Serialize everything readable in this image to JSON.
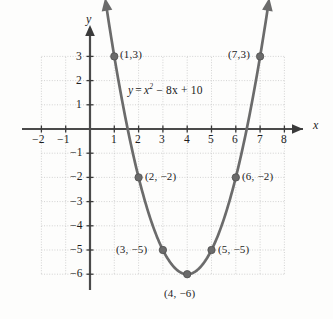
{
  "figure": {
    "type": "coordinate-graph",
    "equation_label": "y = x² − 8x + 10",
    "equation_parts": {
      "lhs": "y",
      "equals": "=",
      "var": "x",
      "exponent": "2",
      "rest": "− 8x + 10"
    },
    "x_axis_name": "x",
    "y_axis_name": "y"
  },
  "chart_data": {
    "type": "line",
    "title": "",
    "subtitle": "",
    "xlabel": "x",
    "ylabel": "y",
    "function": "y = x^2 - 8x + 10",
    "curve_shape": "parabola",
    "vertex": [
      4,
      -6
    ],
    "xlim": [
      -2.6,
      8.6
    ],
    "ylim": [
      -6.8,
      3.8
    ],
    "grid": true,
    "grid_x_range": [
      -2,
      8
    ],
    "grid_y_range": [
      -6,
      3
    ],
    "legend": "none",
    "x_ticks": [
      -2,
      -1,
      1,
      2,
      3,
      4,
      5,
      6,
      7,
      8
    ],
    "x_tick_labels": [
      "−2",
      "−1",
      "1",
      "2",
      "3",
      "4",
      "5",
      "6",
      "7",
      "8"
    ],
    "y_ticks": [
      3,
      2,
      1,
      -1,
      -2,
      -3,
      -4,
      -5,
      -6
    ],
    "y_tick_labels": [
      "3",
      "2",
      "1",
      "−1",
      "−2",
      "−3",
      "−4",
      "−5",
      "−6"
    ],
    "x": [
      1,
      2,
      3,
      4,
      5,
      6,
      7
    ],
    "values": [
      3,
      -2,
      -5,
      -6,
      -5,
      -2,
      3
    ],
    "points": [
      {
        "x": 1,
        "y": 3,
        "label": "(1,3)",
        "label_side": "right"
      },
      {
        "x": 2,
        "y": -2,
        "label": "(2, −2)",
        "label_side": "right"
      },
      {
        "x": 3,
        "y": -5,
        "label": "(3, −5)",
        "label_side": "left"
      },
      {
        "x": 4,
        "y": -6,
        "label": "(4, −6)",
        "label_side": "below"
      },
      {
        "x": 5,
        "y": -5,
        "label": "(5, −5)",
        "label_side": "right"
      },
      {
        "x": 6,
        "y": -2,
        "label": "(6, −2)",
        "label_side": "right"
      },
      {
        "x": 7,
        "y": 3,
        "label": "(7,3)",
        "label_side": "left"
      }
    ],
    "annotations": [
      {
        "text": "y = x² − 8x + 10",
        "x": 2.3,
        "y": 1.35
      }
    ],
    "colors": {
      "curve": "#6b6b6b",
      "point": "#6b6b6b",
      "axis": "#3a3a3a",
      "grid": "#c9c9c9",
      "background": "#fdfdfc",
      "text": "#1c1c1c"
    }
  }
}
